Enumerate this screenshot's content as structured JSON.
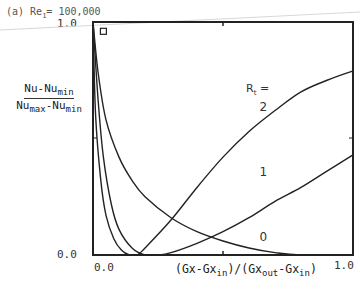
{
  "chart_data": {
    "type": "line",
    "title": "(a) Re",
    "title_sub": "1",
    "title_value": "= 100,000",
    "ylabel": {
      "num_main": "Nu-Nu",
      "num_sub": "min",
      "den_a": "Nu",
      "den_a_sub": "max",
      "den_b": "-Nu",
      "den_b_sub": "min"
    },
    "xlabel": {
      "p1": "(Gx-Gx",
      "s1": "in",
      "p2": ")/(Gx",
      "s2": "out",
      "p3": "-Gx",
      "s3": "in",
      "p4": ")"
    },
    "xlim": [
      0,
      1
    ],
    "ylim": [
      0,
      1
    ],
    "x_ticks": [
      "0.0",
      "1.0"
    ],
    "y_ticks": [
      "0.0",
      "1.0"
    ],
    "legend_title": "R",
    "legend_title_sub": "t",
    "legend_title_suffix": " =",
    "marker_point": {
      "x": 0.04,
      "y": 0.96,
      "shape": "square"
    },
    "series": [
      {
        "name": "0",
        "x": [
          0.0,
          0.02,
          0.05,
          0.1,
          0.15,
          0.2,
          0.3,
          0.4,
          0.5,
          0.6,
          0.7,
          0.8,
          1.0
        ],
        "y": [
          1.0,
          0.78,
          0.58,
          0.42,
          0.32,
          0.25,
          0.16,
          0.1,
          0.06,
          0.03,
          0.01,
          0.0,
          0.0
        ]
      },
      {
        "name": "1",
        "x": [
          0.0,
          0.02,
          0.04,
          0.07,
          0.1,
          0.15,
          0.2,
          0.25,
          0.3,
          0.4,
          0.5,
          0.6,
          0.7,
          0.8,
          0.9,
          1.0
        ],
        "y": [
          1.0,
          0.66,
          0.42,
          0.22,
          0.11,
          0.03,
          0.0,
          0.0,
          0.01,
          0.05,
          0.1,
          0.16,
          0.23,
          0.29,
          0.36,
          0.43
        ]
      },
      {
        "name": "2",
        "x": [
          0.0,
          0.01,
          0.03,
          0.05,
          0.08,
          0.11,
          0.14,
          0.17,
          0.2,
          0.3,
          0.4,
          0.5,
          0.6,
          0.7,
          0.8,
          0.9,
          1.0
        ],
        "y": [
          1.0,
          0.6,
          0.32,
          0.17,
          0.07,
          0.02,
          0.0,
          0.0,
          0.03,
          0.15,
          0.29,
          0.42,
          0.53,
          0.62,
          0.7,
          0.75,
          0.79
        ]
      }
    ],
    "curve_labels": [
      {
        "text": "2",
        "x": 0.64,
        "y": 0.62
      },
      {
        "text": "1",
        "x": 0.64,
        "y": 0.34
      },
      {
        "text": "0",
        "x": 0.64,
        "y": 0.06
      }
    ],
    "grid": false
  }
}
